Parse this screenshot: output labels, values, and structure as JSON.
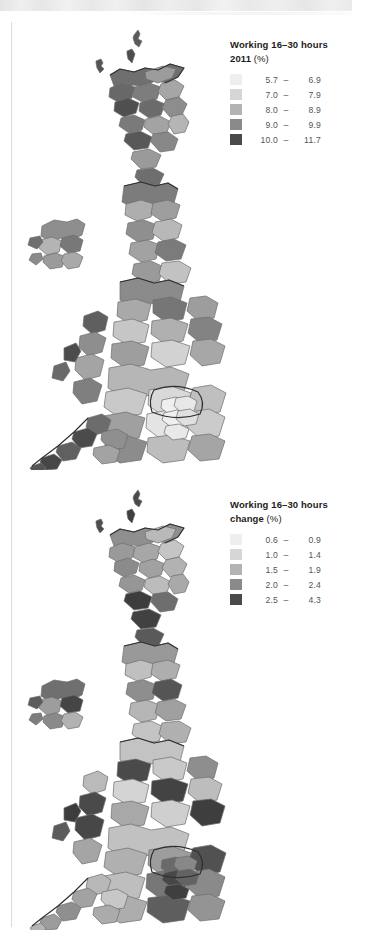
{
  "page": {
    "background": "#ffffff",
    "rule_color": "#dcdcdc"
  },
  "panels": [
    {
      "id": "working-16-30-hours-2011",
      "legend": {
        "title_line1": "Working 16–30 hours",
        "title_line2": "2011",
        "title_unit": "(%)",
        "classes": [
          {
            "swatch": "#eeeeee",
            "low": "5.7",
            "dash": "–",
            "high": "6.9"
          },
          {
            "swatch": "#d6d6d6",
            "low": "7.0",
            "dash": "–",
            "high": "7.9"
          },
          {
            "swatch": "#b3b3b3",
            "low": "8.0",
            "dash": "–",
            "high": "8.9"
          },
          {
            "swatch": "#8a8a8a",
            "low": "9.0",
            "dash": "–",
            "high": "9.9"
          },
          {
            "swatch": "#4a4a4a",
            "low": "10.0",
            "dash": "–",
            "high": "11.7"
          }
        ]
      },
      "map": {
        "name": "uk-cartogram-working-16-30-hours-2011",
        "description": "Gridded population cartogram of the United Kingdom, shaded by percentage of residents working 16 to 30 hours in 2011",
        "stroke": "#6d6d6d",
        "outline": "#2f2f2f"
      }
    },
    {
      "id": "working-16-30-hours-change",
      "legend": {
        "title_line1": "Working 16–30 hours",
        "title_line2": "change",
        "title_unit": "(%)",
        "classes": [
          {
            "swatch": "#eeeeee",
            "low": "0.6",
            "dash": "–",
            "high": "0.9"
          },
          {
            "swatch": "#d6d6d6",
            "low": "1.0",
            "dash": "–",
            "high": "1.4"
          },
          {
            "swatch": "#b3b3b3",
            "low": "1.5",
            "dash": "–",
            "high": "1.9"
          },
          {
            "swatch": "#8a8a8a",
            "low": "2.0",
            "dash": "–",
            "high": "2.4"
          },
          {
            "swatch": "#4a4a4a",
            "low": "2.5",
            "dash": "–",
            "high": "4.3"
          }
        ]
      },
      "map": {
        "name": "uk-cartogram-working-16-30-hours-change",
        "description": "Gridded population cartogram of the United Kingdom, shaded by percentage point change in residents working 16 to 30 hours",
        "stroke": "#6d6d6d",
        "outline": "#2f2f2f"
      }
    }
  ]
}
